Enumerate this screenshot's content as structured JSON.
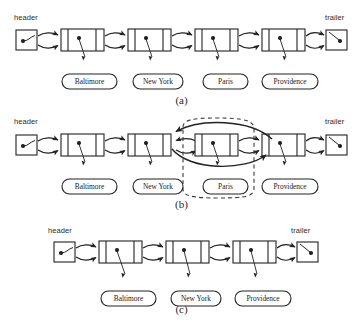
{
  "figure": {
    "stroke_color": "#222222",
    "dashed_color": "#3a3a3a",
    "background": "#ffffff"
  },
  "labels": {
    "header": "header",
    "trailer": "trailer"
  },
  "captions": {
    "a": "(a)",
    "b": "(b)",
    "c": "(c)"
  },
  "panels": [
    {
      "id": "a",
      "caption": "(a)",
      "nodes": [
        "Baltimore",
        "New York",
        "Paris",
        "Providence"
      ],
      "has_header": true,
      "has_trailer": true,
      "removal_highlight": null
    },
    {
      "id": "b",
      "caption": "(b)",
      "nodes": [
        "Baltimore",
        "New York",
        "Paris",
        "Providence"
      ],
      "has_header": true,
      "has_trailer": true,
      "removal_highlight": "Paris"
    },
    {
      "id": "c",
      "caption": "(c)",
      "nodes": [
        "Baltimore",
        "New York",
        "Providence"
      ],
      "has_header": true,
      "has_trailer": true,
      "removal_highlight": null
    }
  ],
  "cities": {
    "baltimore": "Baltimore",
    "new_york": "New York",
    "paris": "Paris",
    "providence": "Providence"
  }
}
